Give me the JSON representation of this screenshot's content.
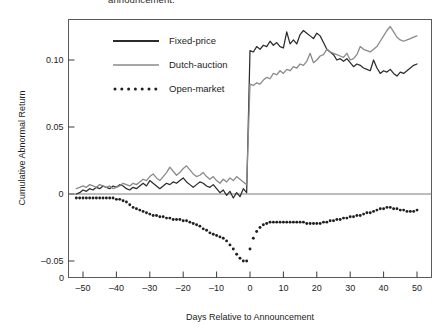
{
  "figure": {
    "clipped_caption_top": "announcement.",
    "background_color": "#ffffff"
  },
  "chart_data": {
    "type": "line",
    "title": "",
    "xlabel": "Days Relative to Announcement",
    "ylabel": "Cumulative Abnormal Return",
    "xlim": [
      -55,
      53
    ],
    "ylim": [
      -0.072,
      0.133
    ],
    "grid": false,
    "legend_position": "top-left",
    "xticks": [
      -50,
      -40,
      -30,
      -20,
      -10,
      0,
      10,
      20,
      30,
      40,
      50
    ],
    "xtick_labels": [
      "–50",
      "–40",
      "–30",
      "–20",
      "–10",
      "0",
      "10",
      "20",
      "30",
      "40",
      "50"
    ],
    "yticks": [
      0.1,
      0.05,
      0,
      -0.05
    ],
    "ytick_labels": [
      "0.10",
      "0.05",
      "0",
      "–0.05"
    ],
    "extra_ytick_label": "0",
    "zero_reference_line": 0,
    "colors": {
      "fixed_price": "#2b2b2b",
      "dutch_auction": "#8a8a8a",
      "open_market": "#1f1f1f",
      "frame": "#5a5a5a"
    },
    "x": [
      -52,
      -51,
      -50,
      -49,
      -48,
      -47,
      -46,
      -45,
      -44,
      -43,
      -42,
      -41,
      -40,
      -39,
      -38,
      -37,
      -36,
      -35,
      -34,
      -33,
      -32,
      -31,
      -30,
      -29,
      -28,
      -27,
      -26,
      -25,
      -24,
      -23,
      -22,
      -21,
      -20,
      -19,
      -18,
      -17,
      -16,
      -15,
      -14,
      -13,
      -12,
      -11,
      -10,
      -9,
      -8,
      -7,
      -6,
      -5,
      -4,
      -3,
      -2,
      -1,
      0,
      1,
      2,
      3,
      4,
      5,
      6,
      7,
      8,
      9,
      10,
      11,
      12,
      13,
      14,
      15,
      16,
      17,
      18,
      19,
      20,
      21,
      22,
      23,
      24,
      25,
      26,
      27,
      28,
      29,
      30,
      31,
      32,
      33,
      34,
      35,
      36,
      37,
      38,
      39,
      40,
      41,
      42,
      43,
      44,
      45,
      46,
      47,
      48,
      49,
      50
    ],
    "series": [
      {
        "name": "Fixed-price",
        "style": "solid",
        "color": "#2b2b2b",
        "values": [
          0.0,
          0.001,
          0.003,
          0.002,
          0.004,
          0.003,
          0.005,
          0.004,
          0.006,
          0.005,
          0.004,
          0.006,
          0.005,
          0.007,
          0.006,
          0.004,
          0.003,
          0.005,
          0.004,
          0.006,
          0.008,
          0.006,
          0.01,
          0.008,
          0.006,
          0.004,
          0.006,
          0.008,
          0.007,
          0.009,
          0.008,
          0.01,
          0.012,
          0.009,
          0.007,
          0.005,
          0.007,
          0.009,
          0.008,
          0.006,
          0.005,
          0.007,
          0.004,
          0.001,
          0.003,
          -0.001,
          0.002,
          -0.003,
          0.001,
          -0.002,
          0.004,
          0.001,
          0.107,
          0.106,
          0.11,
          0.108,
          0.111,
          0.11,
          0.114,
          0.111,
          0.113,
          0.11,
          0.109,
          0.121,
          0.112,
          0.115,
          0.112,
          0.119,
          0.122,
          0.12,
          0.118,
          0.116,
          0.12,
          0.118,
          0.113,
          0.108,
          0.106,
          0.104,
          0.1,
          0.101,
          0.099,
          0.101,
          0.098,
          0.095,
          0.097,
          0.096,
          0.094,
          0.093,
          0.092,
          0.1,
          0.094,
          0.09,
          0.092,
          0.091,
          0.093,
          0.09,
          0.088,
          0.091,
          0.09,
          0.092,
          0.094,
          0.096,
          0.097
        ]
      },
      {
        "name": "Dutch-auction",
        "style": "solid",
        "color": "#8a8a8a",
        "values": [
          0.004,
          0.005,
          0.006,
          0.005,
          0.007,
          0.006,
          0.005,
          0.007,
          0.006,
          0.005,
          0.006,
          0.004,
          0.005,
          0.006,
          0.008,
          0.007,
          0.006,
          0.008,
          0.007,
          0.009,
          0.011,
          0.01,
          0.013,
          0.015,
          0.012,
          0.01,
          0.013,
          0.016,
          0.02,
          0.017,
          0.014,
          0.016,
          0.019,
          0.021,
          0.018,
          0.015,
          0.013,
          0.014,
          0.016,
          0.013,
          0.011,
          0.013,
          0.01,
          0.008,
          0.011,
          0.009,
          0.012,
          0.01,
          0.013,
          0.011,
          0.009,
          0.007,
          0.082,
          0.081,
          0.083,
          0.082,
          0.085,
          0.087,
          0.086,
          0.09,
          0.089,
          0.092,
          0.09,
          0.093,
          0.092,
          0.095,
          0.094,
          0.097,
          0.096,
          0.099,
          0.105,
          0.098,
          0.1,
          0.103,
          0.104,
          0.108,
          0.106,
          0.105,
          0.104,
          0.103,
          0.102,
          0.105,
          0.1,
          0.101,
          0.104,
          0.11,
          0.108,
          0.107,
          0.106,
          0.108,
          0.11,
          0.114,
          0.118,
          0.122,
          0.125,
          0.121,
          0.117,
          0.115,
          0.114,
          0.115,
          0.116,
          0.117,
          0.118
        ]
      },
      {
        "name": "Open-market",
        "style": "dotted",
        "color": "#1f1f1f",
        "values": [
          -0.003,
          -0.003,
          -0.003,
          -0.003,
          -0.003,
          -0.003,
          -0.003,
          -0.003,
          -0.003,
          -0.003,
          -0.003,
          -0.003,
          -0.004,
          -0.004,
          -0.005,
          -0.006,
          -0.008,
          -0.01,
          -0.011,
          -0.012,
          -0.013,
          -0.014,
          -0.015,
          -0.016,
          -0.016,
          -0.017,
          -0.017,
          -0.018,
          -0.018,
          -0.019,
          -0.019,
          -0.019,
          -0.02,
          -0.02,
          -0.021,
          -0.022,
          -0.023,
          -0.024,
          -0.026,
          -0.027,
          -0.029,
          -0.03,
          -0.031,
          -0.032,
          -0.033,
          -0.035,
          -0.038,
          -0.041,
          -0.045,
          -0.048,
          -0.05,
          -0.05,
          -0.041,
          -0.033,
          -0.028,
          -0.025,
          -0.023,
          -0.022,
          -0.021,
          -0.021,
          -0.021,
          -0.021,
          -0.021,
          -0.021,
          -0.021,
          -0.021,
          -0.021,
          -0.021,
          -0.021,
          -0.022,
          -0.022,
          -0.022,
          -0.022,
          -0.022,
          -0.021,
          -0.021,
          -0.02,
          -0.02,
          -0.019,
          -0.019,
          -0.018,
          -0.018,
          -0.017,
          -0.017,
          -0.016,
          -0.016,
          -0.015,
          -0.014,
          -0.014,
          -0.013,
          -0.012,
          -0.011,
          -0.011,
          -0.01,
          -0.01,
          -0.011,
          -0.011,
          -0.012,
          -0.012,
          -0.013,
          -0.013,
          -0.013,
          -0.012
        ]
      }
    ],
    "legend": [
      {
        "label": "Fixed-price",
        "style": "solid",
        "color": "#2b2b2b"
      },
      {
        "label": "Dutch-auction",
        "style": "solid",
        "color": "#8a8a8a"
      },
      {
        "label": "Open-market",
        "style": "dotted",
        "color": "#1f1f1f"
      }
    ]
  }
}
